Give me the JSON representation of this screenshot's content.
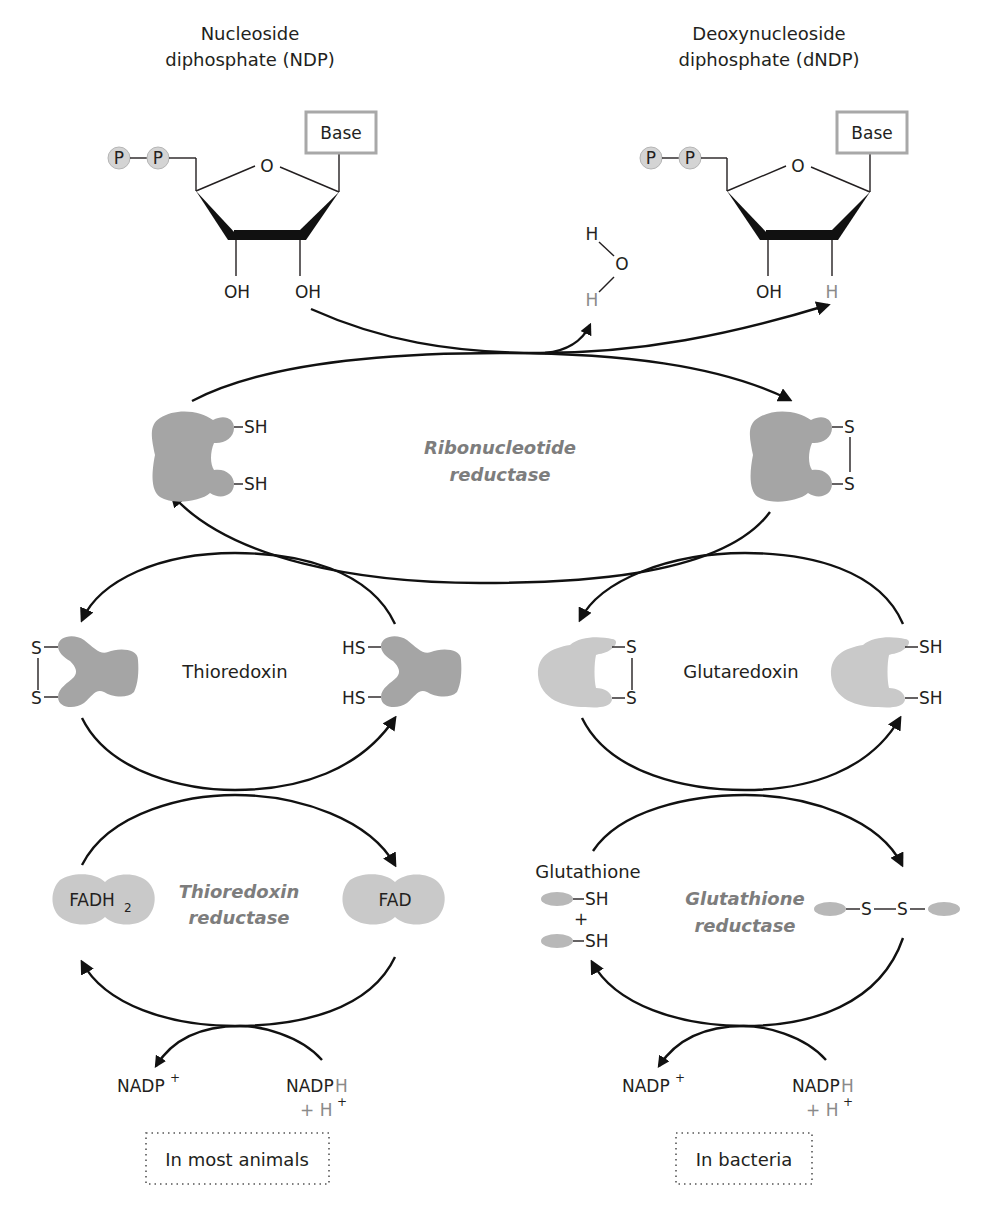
{
  "ndp": {
    "title_line1": "Nucleoside",
    "title_line2": "diphosphate (NDP)",
    "phosphate1": "P",
    "phosphate2": "P",
    "ring_oxygen": "O",
    "base": "Base",
    "oh_left": "OH",
    "oh_right": "OH"
  },
  "dndp": {
    "title_line1": "Deoxynucleoside",
    "title_line2": "diphosphate (dNDP)",
    "phosphate1": "P",
    "phosphate2": "P",
    "ring_oxygen": "O",
    "base": "Base",
    "oh_left": "OH",
    "h_right": "H"
  },
  "water": {
    "h_top": "H",
    "o": "O",
    "h_bottom": "H"
  },
  "ribonucleotide_reductase": {
    "label_line1": "Ribonucleotide",
    "label_line2": "reductase",
    "reduced_sh1": "SH",
    "reduced_sh2": "SH",
    "oxidized_s1": "S",
    "oxidized_s2": "S"
  },
  "thioredoxin": {
    "label": "Thioredoxin",
    "oxidized_s1": "S",
    "oxidized_s2": "S",
    "reduced_hs1": "HS",
    "reduced_hs2": "HS"
  },
  "glutaredoxin": {
    "label": "Glutaredoxin",
    "oxidized_s1": "S",
    "oxidized_s2": "S",
    "reduced_sh1": "SH",
    "reduced_sh2": "SH"
  },
  "thioredoxin_reductase": {
    "label_line1": "Thioredoxin",
    "label_line2": "reductase",
    "fadh2_main": "FADH",
    "fadh2_sub": "2",
    "fad": "FAD"
  },
  "glutathione_reductase": {
    "label_line1": "Glutathione",
    "label_line2": "reductase",
    "glutathione_label": "Glutathione",
    "sh1": "SH",
    "plus": "+",
    "sh2": "SH",
    "disulfide_s1": "S",
    "disulfide_s2": "S"
  },
  "cofactors_left": {
    "nadp_plus": "NADP",
    "nadp_plus_sup": "+",
    "nadph": "NADP",
    "nadph_h": "H",
    "plus_h": "+ H",
    "plus_h_sup": "+"
  },
  "cofactors_right": {
    "nadp_plus": "NADP",
    "nadp_plus_sup": "+",
    "nadph": "NADP",
    "nadph_h": "H",
    "plus_h": "+ H",
    "plus_h_sup": "+"
  },
  "organism_labels": {
    "left": "In most animals",
    "right": "In bacteria"
  }
}
